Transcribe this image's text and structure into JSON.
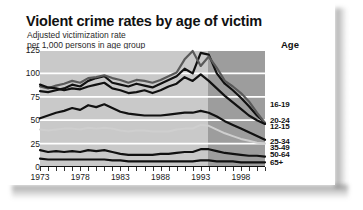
{
  "title": "Violent crime rates by age of victim",
  "subtitle_line1": "Adjusted victimization rate",
  "subtitle_line2": "per 1,000 persons in age group",
  "legend_title": "Age",
  "colors": {
    "plot_band_light": "#c9c9c9",
    "plot_band_dark": "#9d9d9d",
    "gridline": "#ffffff",
    "dark_series": "#111111",
    "mid_series": "#5a5a5a",
    "light_series": "#cfcfcf",
    "card": "#ffffff"
  },
  "chart_data": {
    "type": "line",
    "title": "Violent crime rates by age of victim",
    "subtitle": "Adjusted victimization rate per 1,000 persons in age group",
    "xlabel": "",
    "ylabel": "Adjusted victimization rate per 1,000 persons in age group",
    "ylim": [
      0,
      125
    ],
    "yticks": [
      0,
      25,
      50,
      75,
      100,
      125
    ],
    "xlim": [
      1973,
      2001
    ],
    "xticks": [
      1973,
      1978,
      1983,
      1988,
      1993,
      1998
    ],
    "grid": true,
    "legend_position": "right",
    "shaded_region": {
      "from": 1994,
      "to": 2001,
      "note": "darker background band"
    },
    "x": [
      1973,
      1974,
      1975,
      1976,
      1977,
      1978,
      1979,
      1980,
      1981,
      1982,
      1983,
      1984,
      1985,
      1986,
      1987,
      1988,
      1989,
      1990,
      1991,
      1992,
      1993,
      1994,
      1995,
      1996,
      1997,
      1998,
      1999,
      2000,
      2001
    ],
    "series": [
      {
        "name": "16-19",
        "label": "16-19",
        "color": "#111111",
        "values": [
          81,
          80,
          82,
          84,
          88,
          86,
          92,
          95,
          97,
          90,
          88,
          86,
          89,
          87,
          85,
          89,
          93,
          97,
          105,
          100,
          122,
          120,
          100,
          89,
          82,
          74,
          65,
          55,
          47
        ]
      },
      {
        "name": "12-15",
        "label": "12-15",
        "color": "#5a5a5a",
        "values": [
          86,
          84,
          87,
          89,
          92,
          90,
          95,
          96,
          98,
          95,
          93,
          90,
          93,
          92,
          90,
          93,
          97,
          101,
          115,
          124,
          108,
          118,
          106,
          92,
          86,
          79,
          70,
          58,
          47
        ]
      },
      {
        "name": "20-24",
        "label": "20-24",
        "color": "#111111",
        "values": [
          88,
          85,
          84,
          82,
          84,
          83,
          86,
          88,
          90,
          84,
          82,
          79,
          80,
          82,
          79,
          82,
          86,
          89,
          96,
          92,
          99,
          92,
          84,
          76,
          69,
          62,
          55,
          50,
          46
        ]
      },
      {
        "name": "25-34",
        "label": "25-34",
        "color": "#111111",
        "values": [
          52,
          55,
          58,
          60,
          63,
          61,
          66,
          64,
          67,
          63,
          59,
          57,
          56,
          55,
          55,
          55,
          56,
          57,
          58,
          58,
          60,
          58,
          54,
          49,
          45,
          41,
          37,
          33,
          29
        ]
      },
      {
        "name": "35-49",
        "label": "35-49",
        "color": "#cfcfcf",
        "values": [
          40,
          39,
          40,
          41,
          41,
          40,
          42,
          41,
          42,
          41,
          39,
          38,
          39,
          39,
          38,
          38,
          38,
          40,
          41,
          41,
          45,
          44,
          40,
          36,
          33,
          30,
          28,
          26,
          25
        ]
      },
      {
        "name": "50-64",
        "label": "50-64",
        "color": "#111111",
        "values": [
          18,
          16,
          17,
          16,
          17,
          16,
          18,
          17,
          18,
          16,
          14,
          13,
          13,
          13,
          13,
          14,
          14,
          15,
          16,
          16,
          19,
          19,
          17,
          15,
          14,
          13,
          12,
          12,
          11
        ]
      },
      {
        "name": "65+",
        "label": "65+",
        "color": "#111111",
        "values": [
          9,
          8,
          8,
          8,
          8,
          8,
          8,
          8,
          8,
          7,
          7,
          6,
          6,
          6,
          6,
          6,
          6,
          6,
          6,
          6,
          7,
          7,
          6,
          6,
          6,
          5,
          5,
          5,
          5
        ]
      }
    ],
    "legend_entries": [
      {
        "label": "16-19",
        "y_value": 67
      },
      {
        "label": "20-24",
        "y_value": 50
      },
      {
        "label": "12-15",
        "y_value": 44
      },
      {
        "label": "25-34",
        "y_value": 28
      },
      {
        "label": "35-49",
        "y_value": 21
      },
      {
        "label": "50-64",
        "y_value": 14
      },
      {
        "label": "65+",
        "y_value": 5
      }
    ]
  }
}
